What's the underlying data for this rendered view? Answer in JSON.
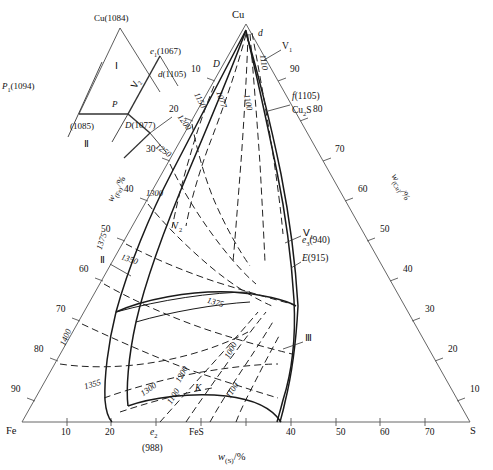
{
  "diagram": {
    "type": "ternary-phase-diagram",
    "system": "Fe-Cu-S",
    "corners": {
      "left": "Fe",
      "top": "Cu",
      "right": "S"
    },
    "axes": {
      "left": {
        "label_w": "w",
        "label_sub": "(Fe)",
        "label_unit": "/%",
        "ticks": [
          "10",
          "20",
          "30",
          "40",
          "50",
          "60",
          "70",
          "80",
          "90"
        ]
      },
      "right": {
        "label_w": "w",
        "label_sub": "(Cu)",
        "label_unit": "/%",
        "ticks": [
          "10",
          "20",
          "30",
          "40",
          "50",
          "60",
          "70",
          "80",
          "90"
        ]
      },
      "bottom": {
        "label_w": "w",
        "label_sub": "(S)",
        "label_unit": "/%",
        "ticks": [
          "10",
          "20",
          "30",
          "40",
          "50",
          "60",
          "70",
          "80",
          "90"
        ]
      }
    },
    "invariant_points": [
      {
        "name": "d",
        "style": "italic",
        "text": "d"
      },
      {
        "name": "D",
        "style": "italic",
        "text": "D"
      },
      {
        "name": "f",
        "text": "f(1105)"
      },
      {
        "name": "cu2s",
        "text": "Cu₂S"
      },
      {
        "name": "e3",
        "text": "e₃(940)"
      },
      {
        "name": "E",
        "text": "E(915)"
      },
      {
        "name": "e2",
        "text": "e₂"
      },
      {
        "name": "e2_temp",
        "text": "(988)"
      },
      {
        "name": "FeS",
        "text": "FeS"
      },
      {
        "name": "K",
        "text": "K"
      }
    ],
    "regions": [
      {
        "name": "V1",
        "text": "V₁"
      },
      {
        "name": "V2",
        "text": "V₂"
      },
      {
        "name": "IV1",
        "text": "Ⅳ₁"
      },
      {
        "name": "II",
        "text": "Ⅱ"
      },
      {
        "name": "III",
        "text": "Ⅲ"
      }
    ],
    "isotherms_main": [
      "1077",
      "1100",
      "1110",
      "1150",
      "1200",
      "1250",
      "1300",
      "1350",
      "1375",
      "1400",
      "1355",
      "1375",
      "1300",
      "1200",
      "1100",
      "1000"
    ],
    "isotherm_labels": [
      {
        "t": "1077"
      },
      {
        "t": "1100"
      },
      {
        "t": "1110"
      },
      {
        "t": "1150"
      },
      {
        "t": "1200"
      },
      {
        "t": "1250"
      },
      {
        "t": "1300"
      },
      {
        "t": "1350"
      },
      {
        "t": "1375"
      },
      {
        "t": "1400"
      },
      {
        "t": "1355"
      },
      {
        "t": "1375"
      },
      {
        "t": "1300"
      },
      {
        "t": "1200"
      },
      {
        "t": "1100"
      },
      {
        "t": "1000"
      }
    ]
  },
  "inset": {
    "name": "copper-corner-detail",
    "labels": {
      "cu": "Cu(1084)",
      "e1": "e₁(1067)",
      "d": "d(1105)",
      "P1": "P₁(1094)",
      "P": "P",
      "p1085": "(1085)",
      "D": "D(1077)",
      "I": "Ⅰ",
      "II": "Ⅱ",
      "IV2": "Ⅳ₂"
    }
  },
  "colors": {
    "line": "#2b2b2b",
    "axis": "#6b6b6b",
    "text": "#111111",
    "background": "#ffffff"
  }
}
